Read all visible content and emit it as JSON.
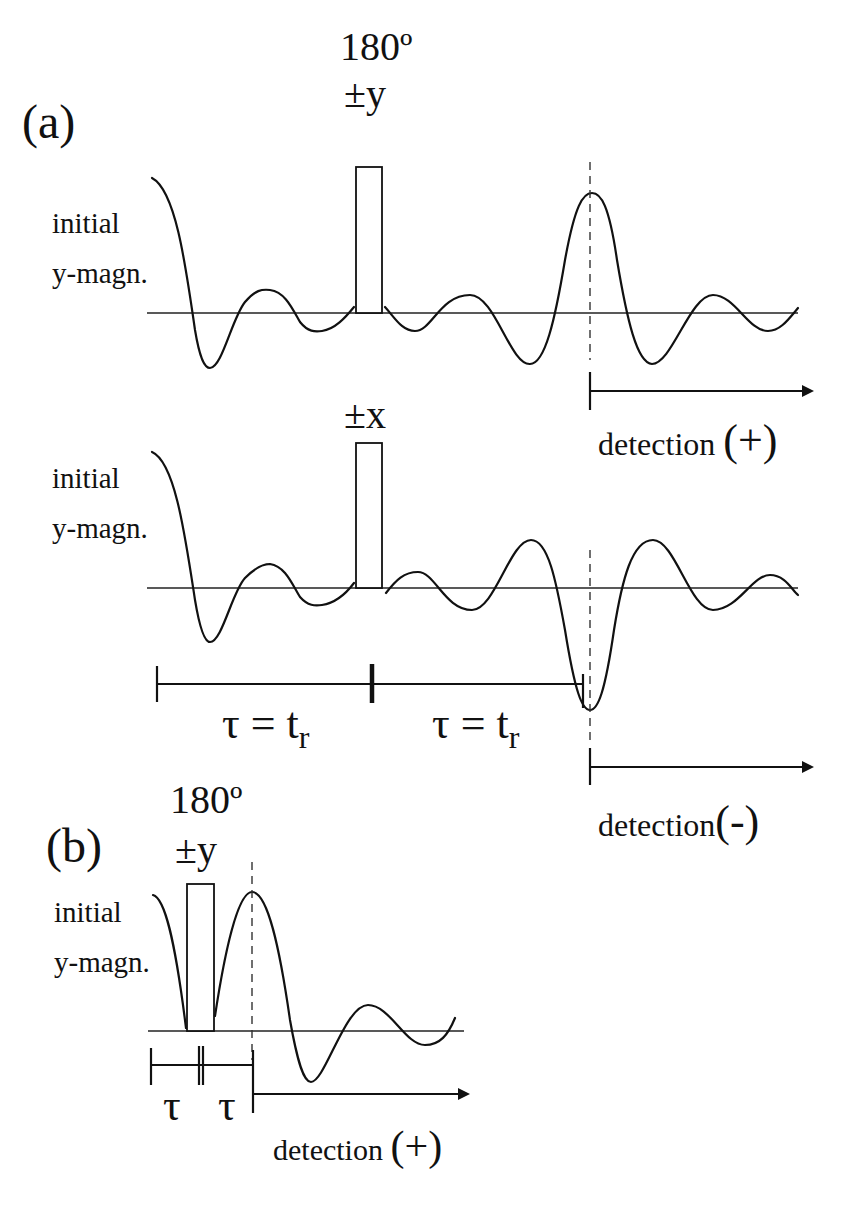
{
  "figure": {
    "panel_a": {
      "label": "(a)",
      "pulse_angle": "180º",
      "trace_top": {
        "y_label_line1": "initial",
        "y_label_line2": "y-magn.",
        "pulse_phase": "±y",
        "detection_label": "detection",
        "detection_sign": "(+)"
      },
      "trace_bottom": {
        "y_label_line1": "initial",
        "y_label_line2": "y-magn.",
        "pulse_phase": "±x",
        "detection_label": "detection",
        "detection_sign": "(-)"
      },
      "timing": {
        "interval1_tau": "τ = t",
        "interval1_sub": "r",
        "interval2_tau": "τ = t",
        "interval2_sub": "r"
      }
    },
    "panel_b": {
      "label": "(b)",
      "pulse_angle": "180º",
      "pulse_phase": "±y",
      "y_label_line1": "initial",
      "y_label_line2": "y-magn.",
      "interval1_tau": "τ",
      "interval2_tau": "τ",
      "detection_label": "detection",
      "detection_sign": "(+)"
    }
  }
}
